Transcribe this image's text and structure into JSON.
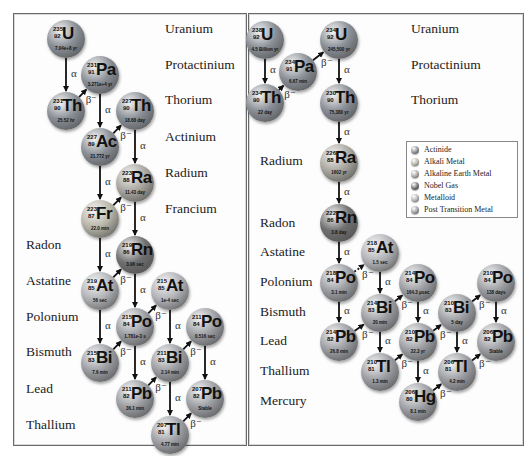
{
  "legend": {
    "items": [
      {
        "label": "Actinide",
        "color": "#8a8f96",
        "type": "actinide"
      },
      {
        "label": "Alkali Metal",
        "color": "#b8b6a8",
        "type": "alkali"
      },
      {
        "label": "Alkaline Earth Metal",
        "color": "#a9a79f",
        "type": "alkaline"
      },
      {
        "label": "Nobel Gas",
        "color": "#6f6f6f",
        "type": "noble"
      },
      {
        "label": "Metalloid",
        "color": "#b3b4b8",
        "type": "metalloid"
      },
      {
        "label": "Post Transition Metal",
        "color": "#9c9ea3",
        "type": "post"
      }
    ]
  },
  "left_panel": {
    "labels": [
      {
        "text": "Uranium",
        "x": 165,
        "y": 30
      },
      {
        "text": "Protactinium",
        "x": 165,
        "y": 66
      },
      {
        "text": "Thorium",
        "x": 165,
        "y": 101
      },
      {
        "text": "Actinium",
        "x": 165,
        "y": 138
      },
      {
        "text": "Radium",
        "x": 165,
        "y": 174
      },
      {
        "text": "Francium",
        "x": 165,
        "y": 210
      },
      {
        "text": "Radon",
        "x": 26,
        "y": 246
      },
      {
        "text": "Astatine",
        "x": 26,
        "y": 282
      },
      {
        "text": "Polonium",
        "x": 26,
        "y": 318
      },
      {
        "text": "Bismuth",
        "x": 26,
        "y": 353
      },
      {
        "text": "Lead",
        "x": 26,
        "y": 390
      },
      {
        "text": "Thallium",
        "x": 26,
        "y": 426
      }
    ],
    "atoms": [
      {
        "id": "U235",
        "sym": "U",
        "mass": "235",
        "z": "92",
        "hl": "7.04e+8 yr",
        "type": "actinide",
        "x": 66,
        "y": 39
      },
      {
        "id": "Pa231",
        "sym": "Pa",
        "mass": "231",
        "z": "91",
        "hl": "3.271e+4 yr",
        "type": "actinide",
        "x": 100,
        "y": 75
      },
      {
        "id": "Th231",
        "sym": "Th",
        "mass": "231",
        "z": "90",
        "hl": "25.52 hr",
        "type": "actinide",
        "x": 66,
        "y": 111
      },
      {
        "id": "Th227",
        "sym": "Th",
        "mass": "227",
        "z": "90",
        "hl": "18.68 day",
        "type": "actinide",
        "x": 135,
        "y": 111
      },
      {
        "id": "Ac227",
        "sym": "Ac",
        "mass": "227",
        "z": "89",
        "hl": "21.772 yr",
        "type": "actinide",
        "x": 100,
        "y": 147
      },
      {
        "id": "Ra223",
        "sym": "Ra",
        "mass": "223",
        "z": "88",
        "hl": "11.43 day",
        "type": "alkaline",
        "x": 135,
        "y": 183
      },
      {
        "id": "Fr223",
        "sym": "Fr",
        "mass": "223",
        "z": "87",
        "hl": "22.0 min",
        "type": "alkali",
        "x": 100,
        "y": 219
      },
      {
        "id": "Rn219",
        "sym": "Rn",
        "mass": "219",
        "z": "86",
        "hl": "3.96 sec",
        "type": "noble",
        "x": 135,
        "y": 255
      },
      {
        "id": "At219",
        "sym": "At",
        "mass": "219",
        "z": "85",
        "hl": "56 sec",
        "type": "metalloid",
        "x": 100,
        "y": 291
      },
      {
        "id": "At215",
        "sym": "At",
        "mass": "215",
        "z": "85",
        "hl": "1e-4 sec",
        "type": "metalloid",
        "x": 170,
        "y": 291
      },
      {
        "id": "Po215",
        "sym": "Po",
        "mass": "215",
        "z": "84",
        "hl": "1.781e-3 s",
        "type": "post",
        "x": 135,
        "y": 327
      },
      {
        "id": "Po211",
        "sym": "Po",
        "mass": "211",
        "z": "84",
        "hl": "0.516 sec",
        "type": "post",
        "x": 205,
        "y": 327
      },
      {
        "id": "Bi215",
        "sym": "Bi",
        "mass": "215",
        "z": "83",
        "hl": "7.6 min",
        "type": "post",
        "x": 100,
        "y": 363
      },
      {
        "id": "Bi211",
        "sym": "Bi",
        "mass": "211",
        "z": "83",
        "hl": "2.14 min",
        "type": "post",
        "x": 170,
        "y": 363
      },
      {
        "id": "Pb211",
        "sym": "Pb",
        "mass": "211",
        "z": "82",
        "hl": "36.1 min",
        "type": "post",
        "x": 135,
        "y": 399
      },
      {
        "id": "Pb207",
        "sym": "Pb",
        "mass": "207",
        "z": "82",
        "hl": "Stable",
        "type": "post",
        "x": 205,
        "y": 399
      },
      {
        "id": "Tl207",
        "sym": "Tl",
        "mass": "207",
        "z": "81",
        "hl": "4.77 min",
        "type": "post",
        "x": 170,
        "y": 435
      }
    ],
    "decays": [
      {
        "from": "U235",
        "to": "Th231",
        "kind": "α"
      },
      {
        "from": "Th231",
        "to": "Pa231",
        "kind": "β⁻"
      },
      {
        "from": "Pa231",
        "to": "Ac227",
        "kind": "α"
      },
      {
        "from": "Ac227",
        "to": "Th227",
        "kind": "β⁻"
      },
      {
        "from": "Ac227",
        "to": "Fr223",
        "kind": "α"
      },
      {
        "from": "Th227",
        "to": "Ra223",
        "kind": "α"
      },
      {
        "from": "Fr223",
        "to": "Ra223",
        "kind": "β⁻"
      },
      {
        "from": "Ra223",
        "to": "Rn219",
        "kind": "α"
      },
      {
        "from": "Fr223",
        "to": "At219",
        "kind": "α"
      },
      {
        "from": "At219",
        "to": "Rn219",
        "kind": "β⁻"
      },
      {
        "from": "Rn219",
        "to": "Po215",
        "kind": "α"
      },
      {
        "from": "At219",
        "to": "Bi215",
        "kind": "α"
      },
      {
        "from": "Po215",
        "to": "At215",
        "kind": "β⁻"
      },
      {
        "from": "Bi215",
        "to": "Po215",
        "kind": "β⁻"
      },
      {
        "from": "At215",
        "to": "Bi211",
        "kind": "α"
      },
      {
        "from": "Po215",
        "to": "Pb211",
        "kind": "α"
      },
      {
        "from": "Bi211",
        "to": "Po211",
        "kind": "β⁻"
      },
      {
        "from": "Pb211",
        "to": "Bi211",
        "kind": "β⁻"
      },
      {
        "from": "Po211",
        "to": "Pb207",
        "kind": "α"
      },
      {
        "from": "Bi211",
        "to": "Tl207",
        "kind": "α"
      },
      {
        "from": "Tl207",
        "to": "Pb207",
        "kind": "β⁻"
      }
    ]
  },
  "right_panel": {
    "labels": [
      {
        "text": "Uranium",
        "x": 411,
        "y": 30
      },
      {
        "text": "Protactinium",
        "x": 411,
        "y": 66
      },
      {
        "text": "Thorium",
        "x": 411,
        "y": 101
      },
      {
        "text": "Radium",
        "x": 260,
        "y": 162
      },
      {
        "text": "Radon",
        "x": 260,
        "y": 224
      },
      {
        "text": "Astatine",
        "x": 260,
        "y": 253
      },
      {
        "text": "Polonium",
        "x": 260,
        "y": 283
      },
      {
        "text": "Bismuth",
        "x": 260,
        "y": 313
      },
      {
        "text": "Lead",
        "x": 260,
        "y": 342
      },
      {
        "text": "Thallium",
        "x": 260,
        "y": 372
      },
      {
        "text": "Mercury",
        "x": 260,
        "y": 402
      }
    ],
    "atoms": [
      {
        "id": "U238",
        "sym": "U",
        "mass": "238",
        "z": "92",
        "hl": "4.5 Billion yr",
        "type": "actinide",
        "x": 265,
        "y": 40
      },
      {
        "id": "Pa234",
        "sym": "Pa",
        "mass": "234",
        "z": "91",
        "hl": "6.67 min",
        "type": "actinide",
        "x": 298,
        "y": 72
      },
      {
        "id": "U234",
        "sym": "U",
        "mass": "234",
        "z": "92",
        "hl": "245,500 yr",
        "type": "actinide",
        "x": 339,
        "y": 40
      },
      {
        "id": "Th234",
        "sym": "Th",
        "mass": "234",
        "z": "90",
        "hl": "22 day",
        "type": "actinide",
        "x": 265,
        "y": 103
      },
      {
        "id": "Th230",
        "sym": "Th",
        "mass": "230",
        "z": "90",
        "hl": "75,380 yr",
        "type": "actinide",
        "x": 339,
        "y": 103
      },
      {
        "id": "Ra226",
        "sym": "Ra",
        "mass": "226",
        "z": "88",
        "hl": "1602 yr",
        "type": "alkaline",
        "x": 339,
        "y": 163
      },
      {
        "id": "Rn222",
        "sym": "Rn",
        "mass": "222",
        "z": "86",
        "hl": "3.8 day",
        "type": "noble",
        "x": 339,
        "y": 223
      },
      {
        "id": "At218",
        "sym": "At",
        "mass": "218",
        "z": "85",
        "hl": "1.5 sec",
        "type": "metalloid",
        "x": 380,
        "y": 253
      },
      {
        "id": "Po218",
        "sym": "Po",
        "mass": "218",
        "z": "84",
        "hl": "3.1 min",
        "type": "post",
        "x": 339,
        "y": 283
      },
      {
        "id": "Po214",
        "sym": "Po",
        "mass": "214",
        "z": "84",
        "hl": "164.3 μsec",
        "type": "post",
        "x": 418,
        "y": 283
      },
      {
        "id": "Po210",
        "sym": "Po",
        "mass": "210",
        "z": "84",
        "hl": "138 days",
        "type": "post",
        "x": 496,
        "y": 283
      },
      {
        "id": "Bi214",
        "sym": "Bi",
        "mass": "214",
        "z": "83",
        "hl": "20 min",
        "type": "post",
        "x": 380,
        "y": 313
      },
      {
        "id": "Bi210",
        "sym": "Bi",
        "mass": "210",
        "z": "83",
        "hl": "5 day",
        "type": "post",
        "x": 457,
        "y": 313
      },
      {
        "id": "Pb214",
        "sym": "Pb",
        "mass": "214",
        "z": "82",
        "hl": "26.8 min",
        "type": "post",
        "x": 339,
        "y": 342
      },
      {
        "id": "Pb210",
        "sym": "Pb",
        "mass": "210",
        "z": "82",
        "hl": "22.3 yr",
        "type": "post",
        "x": 418,
        "y": 342
      },
      {
        "id": "Pb206",
        "sym": "Pb",
        "mass": "206",
        "z": "82",
        "hl": "Stable",
        "type": "post",
        "x": 496,
        "y": 342
      },
      {
        "id": "Tl210",
        "sym": "Tl",
        "mass": "210",
        "z": "81",
        "hl": "1.3 min",
        "type": "post",
        "x": 380,
        "y": 372
      },
      {
        "id": "Tl206",
        "sym": "Tl",
        "mass": "206",
        "z": "81",
        "hl": "4.2 min",
        "type": "post",
        "x": 457,
        "y": 372
      },
      {
        "id": "Hg206",
        "sym": "Hg",
        "mass": "206",
        "z": "80",
        "hl": "8.1 min",
        "type": "post",
        "x": 418,
        "y": 402
      }
    ],
    "decays": [
      {
        "from": "U238",
        "to": "Th234",
        "kind": "α"
      },
      {
        "from": "Th234",
        "to": "Pa234",
        "kind": "β⁻"
      },
      {
        "from": "Pa234",
        "to": "U234",
        "kind": "β⁻"
      },
      {
        "from": "U234",
        "to": "Th230",
        "kind": "α"
      },
      {
        "from": "Th230",
        "to": "Ra226",
        "kind": "α"
      },
      {
        "from": "Ra226",
        "to": "Rn222",
        "kind": "α"
      },
      {
        "from": "Rn222",
        "to": "Po218",
        "kind": "α"
      },
      {
        "from": "Po218",
        "to": "At218",
        "kind": "β⁻",
        "dashed": true
      },
      {
        "from": "Po218",
        "to": "Pb214",
        "kind": "α"
      },
      {
        "from": "At218",
        "to": "Bi214",
        "kind": "α"
      },
      {
        "from": "Pb214",
        "to": "Bi214",
        "kind": "β⁻"
      },
      {
        "from": "Bi214",
        "to": "Po214",
        "kind": "β⁻"
      },
      {
        "from": "Bi214",
        "to": "Tl210",
        "kind": "α"
      },
      {
        "from": "Po214",
        "to": "Pb210",
        "kind": "α"
      },
      {
        "from": "Tl210",
        "to": "Pb210",
        "kind": "β⁻"
      },
      {
        "from": "Pb210",
        "to": "Bi210",
        "kind": "β⁻"
      },
      {
        "from": "Pb210",
        "to": "Hg206",
        "kind": "α"
      },
      {
        "from": "Hg206",
        "to": "Tl206",
        "kind": "β⁻"
      },
      {
        "from": "Bi210",
        "to": "Po210",
        "kind": "β⁻"
      },
      {
        "from": "Bi210",
        "to": "Tl206",
        "kind": "α"
      },
      {
        "from": "Tl206",
        "to": "Pb206",
        "kind": "β⁻"
      },
      {
        "from": "Po210",
        "to": "Pb206",
        "kind": "α"
      }
    ]
  }
}
